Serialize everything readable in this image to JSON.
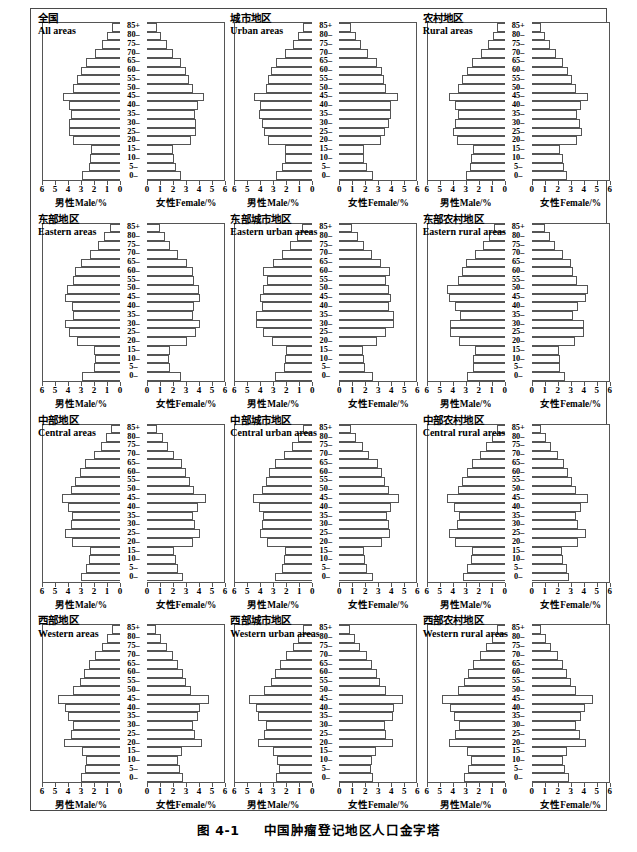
{
  "figure": {
    "caption": "图 4-1　中国肿瘤登记地区人口金字塔",
    "caption_number": "图 4-1",
    "caption_text": "中国肿瘤登记地区人口金字塔"
  },
  "axis": {
    "male_label_cn": "男性",
    "male_label_en": "Male/%",
    "female_label_cn": "女性",
    "female_label_en": "Female/%",
    "male_ticks": [
      "6",
      "5",
      "4",
      "3",
      "2",
      "1",
      "0"
    ],
    "female_ticks": [
      "0",
      "1",
      "2",
      "3",
      "4",
      "5",
      "6"
    ],
    "max": 6,
    "age_labels": [
      "85+",
      "80–",
      "75–",
      "70–",
      "65–",
      "60–",
      "55–",
      "50–",
      "45–",
      "40–",
      "35–",
      "30–",
      "25–",
      "20–",
      "15–",
      "10–",
      "5–",
      "0–"
    ]
  },
  "chart_data": {
    "type": "bar",
    "subtype": "population-pyramid",
    "title": "中国肿瘤登记地区人口金字塔",
    "title_en": "Population pyramids of cancer registration areas in China",
    "xlabel_left": "男性Male/%",
    "xlabel_right": "女性Female/%",
    "ylabel": "Age group (years)",
    "xlim": [
      0,
      6
    ],
    "grid": false,
    "legend": "none",
    "categories": [
      "85+",
      "80–",
      "75–",
      "70–",
      "65–",
      "60–",
      "55–",
      "50–",
      "45–",
      "40–",
      "35–",
      "30–",
      "25–",
      "20–",
      "15–",
      "10–",
      "5–",
      "0–"
    ],
    "panels": [
      {
        "id": "all-areas",
        "title_cn": "全国",
        "title_en": "All areas",
        "series": [
          {
            "name": "Male",
            "values": [
              0.6,
              1.0,
              1.4,
              1.9,
              2.6,
              3.0,
              3.3,
              3.6,
              4.4,
              3.9,
              3.8,
              3.9,
              3.9,
              3.6,
              2.2,
              2.3,
              2.4,
              2.9
            ]
          },
          {
            "name": "Female",
            "values": [
              0.8,
              1.1,
              1.5,
              2.0,
              2.6,
              3.0,
              3.2,
              3.5,
              4.4,
              3.9,
              3.7,
              3.8,
              3.8,
              3.4,
              2.0,
              2.1,
              2.2,
              2.6
            ]
          }
        ]
      },
      {
        "id": "urban-areas",
        "title_cn": "城市地区",
        "title_en": "Urban areas",
        "series": [
          {
            "name": "Male",
            "values": [
              0.7,
              1.1,
              1.5,
              2.1,
              2.8,
              3.2,
              3.4,
              3.6,
              4.5,
              4.0,
              4.1,
              3.9,
              3.7,
              3.4,
              2.1,
              2.1,
              2.3,
              2.8
            ]
          },
          {
            "name": "Female",
            "values": [
              0.9,
              1.3,
              1.7,
              2.2,
              2.9,
              3.3,
              3.4,
              3.6,
              4.5,
              4.0,
              4.0,
              3.8,
              3.5,
              3.2,
              1.9,
              1.9,
              2.1,
              2.6
            ]
          }
        ]
      },
      {
        "id": "rural-areas",
        "title_cn": "农村地区",
        "title_en": "Rural areas",
        "series": [
          {
            "name": "Male",
            "values": [
              0.6,
              0.9,
              1.3,
              1.8,
              2.5,
              2.9,
              3.3,
              3.6,
              4.3,
              3.8,
              3.6,
              3.8,
              4.0,
              3.7,
              2.4,
              2.6,
              2.7,
              3.0
            ]
          },
          {
            "name": "Female",
            "values": [
              0.7,
              1.0,
              1.4,
              1.9,
              2.4,
              2.8,
              3.1,
              3.4,
              4.3,
              3.8,
              3.5,
              3.7,
              3.9,
              3.5,
              2.2,
              2.4,
              2.5,
              2.7
            ]
          }
        ]
      },
      {
        "id": "eastern-areas",
        "title_cn": "东部地区",
        "title_en": "Eastern areas",
        "series": [
          {
            "name": "Male",
            "values": [
              0.8,
              1.2,
              1.7,
              2.3,
              3.0,
              3.5,
              3.6,
              4.1,
              4.2,
              3.7,
              3.6,
              4.2,
              3.9,
              3.3,
              2.0,
              1.9,
              2.0,
              2.9
            ]
          },
          {
            "name": "Female",
            "values": [
              1.0,
              1.4,
              1.8,
              2.4,
              3.1,
              3.5,
              3.6,
              4.0,
              4.1,
              3.6,
              3.5,
              4.1,
              3.8,
              3.1,
              1.8,
              1.7,
              1.8,
              2.6
            ]
          }
        ]
      },
      {
        "id": "eastern-urban-areas",
        "title_cn": "东部城市地区",
        "title_en": "Eastern urban areas",
        "series": [
          {
            "name": "Male",
            "values": [
              0.8,
              1.2,
              1.7,
              2.3,
              3.0,
              3.8,
              3.5,
              3.8,
              4.0,
              3.9,
              4.3,
              4.3,
              3.8,
              3.1,
              2.0,
              2.1,
              2.2,
              2.9
            ]
          },
          {
            "name": "Female",
            "values": [
              1.0,
              1.4,
              1.9,
              2.5,
              3.2,
              3.9,
              3.6,
              3.8,
              4.0,
              3.8,
              4.2,
              4.2,
              3.6,
              2.9,
              1.8,
              1.9,
              2.0,
              2.6
            ]
          }
        ]
      },
      {
        "id": "eastern-rural-areas",
        "title_cn": "东部农村地区",
        "title_en": "Eastern rural areas",
        "series": [
          {
            "name": "Male",
            "values": [
              0.8,
              1.2,
              1.7,
              2.3,
              3.0,
              3.3,
              3.6,
              4.4,
              4.3,
              3.8,
              3.4,
              4.2,
              4.2,
              3.5,
              2.3,
              2.4,
              2.4,
              2.9
            ]
          },
          {
            "name": "Female",
            "values": [
              1.0,
              1.4,
              1.8,
              2.4,
              3.0,
              3.2,
              3.5,
              4.3,
              4.2,
              3.6,
              3.2,
              4.0,
              4.0,
              3.3,
              2.1,
              2.2,
              2.2,
              2.6
            ]
          }
        ]
      },
      {
        "id": "central-areas",
        "title_cn": "中部地区",
        "title_en": "Central areas",
        "series": [
          {
            "name": "Male",
            "values": [
              0.7,
              1.1,
              1.5,
              2.0,
              2.7,
              3.1,
              3.5,
              3.8,
              4.5,
              4.0,
              3.7,
              3.8,
              4.2,
              3.7,
              2.3,
              2.4,
              2.6,
              3.0
            ]
          },
          {
            "name": "Female",
            "values": [
              0.8,
              1.2,
              1.6,
              2.1,
              2.7,
              3.0,
              3.3,
              3.6,
              4.5,
              3.9,
              3.5,
              3.7,
              4.1,
              3.5,
              2.1,
              2.2,
              2.4,
              2.8
            ]
          }
        ]
      },
      {
        "id": "central-urban-areas",
        "title_cn": "中部城市地区",
        "title_en": "Central urban areas",
        "series": [
          {
            "name": "Male",
            "values": [
              0.7,
              1.1,
              1.6,
              2.2,
              2.9,
              3.3,
              3.6,
              3.9,
              4.6,
              4.1,
              3.8,
              3.9,
              4.0,
              3.5,
              2.1,
              2.2,
              2.3,
              2.9
            ]
          },
          {
            "name": "Female",
            "values": [
              0.9,
              1.3,
              1.8,
              2.3,
              3.0,
              3.3,
              3.5,
              3.8,
              4.6,
              4.0,
              3.7,
              3.8,
              3.9,
              3.3,
              1.9,
              2.0,
              2.1,
              2.6
            ]
          }
        ]
      },
      {
        "id": "central-rural-areas",
        "title_cn": "中部农村地区",
        "title_en": "Central rural areas",
        "series": [
          {
            "name": "Male",
            "values": [
              0.6,
              1.0,
              1.4,
              1.9,
              2.5,
              2.9,
              3.3,
              3.6,
              4.4,
              3.9,
              3.5,
              3.7,
              4.3,
              3.8,
              2.5,
              2.6,
              2.9,
              3.2
            ]
          },
          {
            "name": "Female",
            "values": [
              0.7,
              1.1,
              1.5,
              2.0,
              2.5,
              2.8,
              3.1,
              3.4,
              4.3,
              3.8,
              3.4,
              3.6,
              4.2,
              3.6,
              2.3,
              2.4,
              2.7,
              2.9
            ]
          }
        ]
      },
      {
        "id": "western-areas",
        "title_cn": "西部地区",
        "title_en": "Western areas",
        "series": [
          {
            "name": "Male",
            "values": [
              0.6,
              1.0,
              1.4,
              1.9,
              2.4,
              2.8,
              3.1,
              3.6,
              4.8,
              4.2,
              4.0,
              3.6,
              3.8,
              4.3,
              2.9,
              2.6,
              2.7,
              3.0
            ]
          },
          {
            "name": "Female",
            "values": [
              0.7,
              1.1,
              1.5,
              2.0,
              2.4,
              2.8,
              3.0,
              3.4,
              4.8,
              4.1,
              3.9,
              3.5,
              3.7,
              4.2,
              2.7,
              2.4,
              2.5,
              2.8
            ]
          }
        ]
      },
      {
        "id": "western-urban-areas",
        "title_cn": "西部城市地区",
        "title_en": "Western urban areas",
        "series": [
          {
            "name": "Male",
            "values": [
              0.7,
              1.1,
              1.5,
              2.0,
              2.5,
              2.9,
              3.2,
              3.7,
              4.9,
              4.3,
              4.2,
              3.6,
              3.7,
              4.2,
              3.0,
              2.7,
              2.6,
              2.8
            ]
          },
          {
            "name": "Female",
            "values": [
              0.8,
              1.2,
              1.6,
              2.1,
              2.5,
              2.9,
              3.1,
              3.6,
              4.9,
              4.2,
              4.1,
              3.5,
              3.6,
              4.1,
              2.8,
              2.5,
              2.4,
              2.6
            ]
          }
        ]
      },
      {
        "id": "western-rural-areas",
        "title_cn": "西部农村地区",
        "title_en": "Western rural areas",
        "series": [
          {
            "name": "Male",
            "values": [
              0.6,
              1.0,
              1.4,
              1.9,
              2.4,
              2.8,
              3.1,
              3.6,
              4.8,
              4.2,
              3.9,
              3.5,
              3.8,
              4.3,
              2.9,
              2.6,
              2.8,
              3.1
            ]
          },
          {
            "name": "Female",
            "values": [
              0.7,
              1.1,
              1.5,
              2.0,
              2.4,
              2.7,
              3.0,
              3.4,
              4.7,
              4.1,
              3.8,
              3.4,
              3.7,
              4.2,
              2.7,
              2.4,
              2.6,
              2.9
            ]
          }
        ]
      }
    ]
  }
}
